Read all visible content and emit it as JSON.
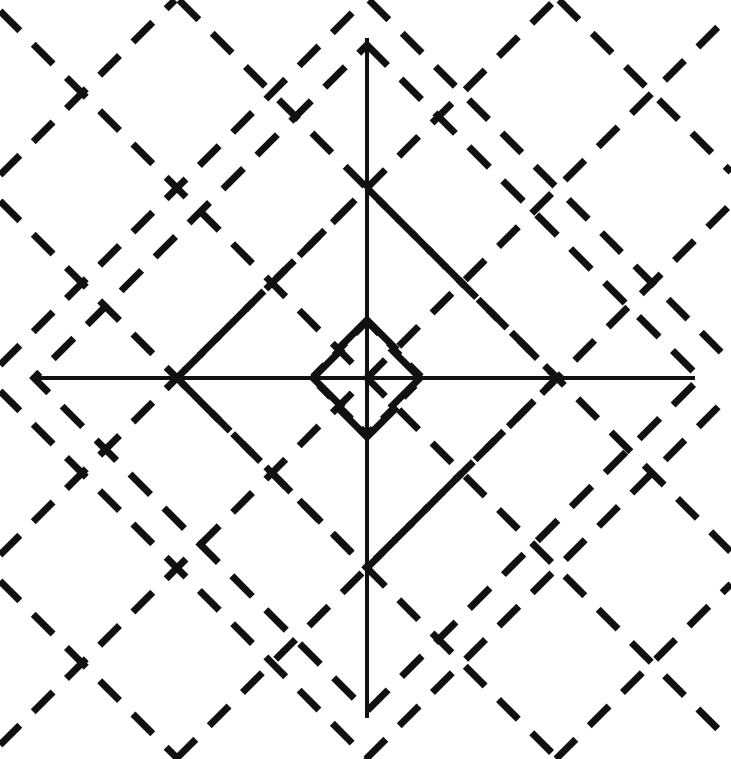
{
  "figure": {
    "canvas": {
      "width": 731,
      "height": 759,
      "background_color": "#ffffff",
      "ink_color": "#111111"
    },
    "center": {
      "x": 367,
      "y": 378,
      "label": "origin"
    },
    "axes": {
      "stroke_width": 4,
      "horizontal": {
        "name": "horizontal-axis",
        "x1": 35,
        "y1": 378,
        "x2": 695,
        "y2": 378,
        "length": 660
      },
      "vertical": {
        "name": "vertical-axis",
        "x1": 367,
        "y1": 38,
        "x2": 367,
        "y2": 718,
        "length": 680
      }
    },
    "arrowheads": {
      "stroke_width": 7,
      "barb_length": 30,
      "items": [
        {
          "name": "arrowhead-up",
          "direction": "up",
          "tip_x": 367,
          "tip_y": 320
        },
        {
          "name": "arrowhead-right",
          "direction": "right",
          "tip_x": 420,
          "tip_y": 378
        },
        {
          "name": "arrowhead-down",
          "direction": "down",
          "tip_x": 367,
          "tip_y": 437
        },
        {
          "name": "arrowhead-left",
          "direction": "left",
          "tip_x": 313,
          "tip_y": 378
        }
      ]
    },
    "diamonds": [
      {
        "name": "diamond-inner",
        "radius": 56,
        "stroke_width": 6,
        "dash": "17 13"
      },
      {
        "name": "diamond-middle",
        "radius": 190,
        "stroke_width": 7,
        "dash": "26 17"
      },
      {
        "name": "diamond-outer",
        "radius": 333,
        "stroke_width": 7,
        "dash": "29 19"
      }
    ],
    "diagonal_families": {
      "stroke_width": 7,
      "dash": "28 19",
      "spacing": 190,
      "note": "Parallel dashed lines at +45 and -45 degrees, clipped to the square canvas; they pass through the diamond corner points and continue into the four corners of the panel.",
      "down_right_offsets": [
        -570,
        -380,
        -190,
        0,
        190,
        380,
        570
      ],
      "up_right_offsets": [
        -570,
        -380,
        -190,
        0,
        190,
        380,
        570
      ]
    }
  },
  "chart_data": {
    "type": "line",
    "subtitle": "",
    "xlabel": "",
    "ylabel": "",
    "xlim": [
      -333,
      333
    ],
    "ylim": [
      -333,
      333
    ],
    "grid": false,
    "legend_position": "none",
    "tick_labels_x": [],
    "tick_labels_y": [],
    "annotations": [],
    "series": [
      {
        "name": "inner diamond",
        "style": "dashed",
        "radius": 56,
        "vertices": [
          [
            0,
            56
          ],
          [
            56,
            0
          ],
          [
            0,
            -56
          ],
          [
            -56,
            0
          ]
        ]
      },
      {
        "name": "middle diamond",
        "style": "dashed",
        "radius": 190,
        "vertices": [
          [
            0,
            190
          ],
          [
            190,
            0
          ],
          [
            0,
            -190
          ],
          [
            -190,
            0
          ]
        ]
      },
      {
        "name": "outer diamond",
        "style": "dashed",
        "radius": 333,
        "vertices": [
          [
            0,
            333
          ],
          [
            333,
            0
          ],
          [
            0,
            -333
          ],
          [
            -333,
            0
          ]
        ]
      },
      {
        "name": "horizontal axis",
        "style": "solid",
        "points": [
          [
            -332,
            0
          ],
          [
            328,
            0
          ]
        ]
      },
      {
        "name": "vertical axis",
        "style": "solid",
        "points": [
          [
            0,
            340
          ],
          [
            0,
            -340
          ]
        ]
      }
    ]
  }
}
